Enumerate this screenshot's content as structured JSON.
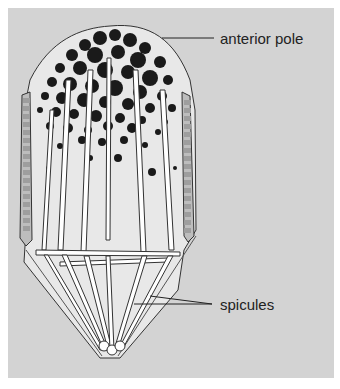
{
  "figure": {
    "background": "#d3d3d3",
    "labels": [
      {
        "id": "anterior-pole",
        "text": "anterior pole",
        "x": 220,
        "y": 30
      },
      {
        "id": "spicules",
        "text": "spicules",
        "x": 220,
        "y": 297
      }
    ],
    "colors": {
      "granule": "#1a1a1a",
      "outline": "#333333",
      "cytoplasm": "#e8e8e8",
      "spicule": "#ffffff",
      "band": "#a8a8a8"
    }
  }
}
